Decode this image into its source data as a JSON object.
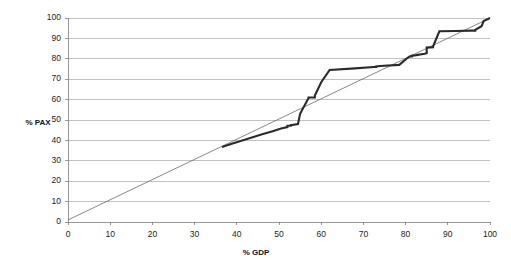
{
  "chart_data": {
    "type": "line",
    "title": "",
    "xlabel": "% GDP",
    "ylabel": "% PAX",
    "xlim": [
      0,
      100
    ],
    "ylim": [
      0,
      100
    ],
    "xticks": [
      0,
      10,
      20,
      30,
      40,
      50,
      60,
      70,
      80,
      90,
      100
    ],
    "yticks": [
      0,
      10,
      20,
      30,
      40,
      50,
      60,
      70,
      80,
      90,
      100
    ],
    "grid": "horizontal",
    "legend": "none",
    "colors": {
      "lorenz_curve": "#2b2b2b",
      "equality_line": "#555555",
      "gridlines": "#9a9a9a",
      "axes": "#7d7d7d",
      "background": "#ffffff"
    },
    "series": [
      {
        "name": "Line of equality",
        "style": "thin-straight",
        "x": [
          0,
          100
        ],
        "values": [
          1,
          100
        ]
      },
      {
        "name": "% PAX vs % GDP cumulative curve",
        "style": "thick-step",
        "x": [
          36.5,
          39.0,
          43.0,
          46.0,
          48.5,
          50.5,
          52.0,
          52.0,
          52.8,
          52.8,
          54.5,
          55.0,
          57.0,
          57.0,
          58.5,
          58.5,
          60.0,
          62.0,
          68.0,
          72.5,
          73.0,
          73.0,
          74.0,
          78.5,
          80.5,
          81.0,
          81.5,
          81.5,
          82.5,
          84.5,
          85.0,
          85.0,
          86.5,
          86.5,
          88.0,
          92.0,
          95.5,
          96.5,
          96.5,
          98.0,
          98.5,
          100.0
        ],
        "values": [
          36.8,
          38.5,
          41.0,
          43.0,
          44.5,
          45.8,
          46.5,
          47.2,
          47.2,
          47.5,
          48.0,
          53.0,
          60.8,
          61.0,
          61.0,
          62.0,
          68.5,
          74.5,
          75.3,
          76.0,
          76.0,
          76.3,
          76.5,
          77.0,
          80.5,
          81.2,
          81.2,
          81.5,
          81.8,
          82.5,
          82.8,
          85.5,
          85.7,
          86.0,
          93.5,
          93.6,
          93.8,
          93.8,
          94.2,
          96.0,
          98.5,
          100.0
        ]
      }
    ],
    "annotations": []
  },
  "axes": {
    "y_axis_label": "% PAX",
    "x_axis_label": "% GDP",
    "y_tick_labels": [
      "100",
      "90",
      "80",
      "70",
      "60",
      "50",
      "40",
      "30",
      "20",
      "10",
      "0"
    ],
    "x_tick_labels": [
      "0",
      "10",
      "20",
      "30",
      "40",
      "50",
      "60",
      "70",
      "80",
      "90",
      "100"
    ]
  }
}
